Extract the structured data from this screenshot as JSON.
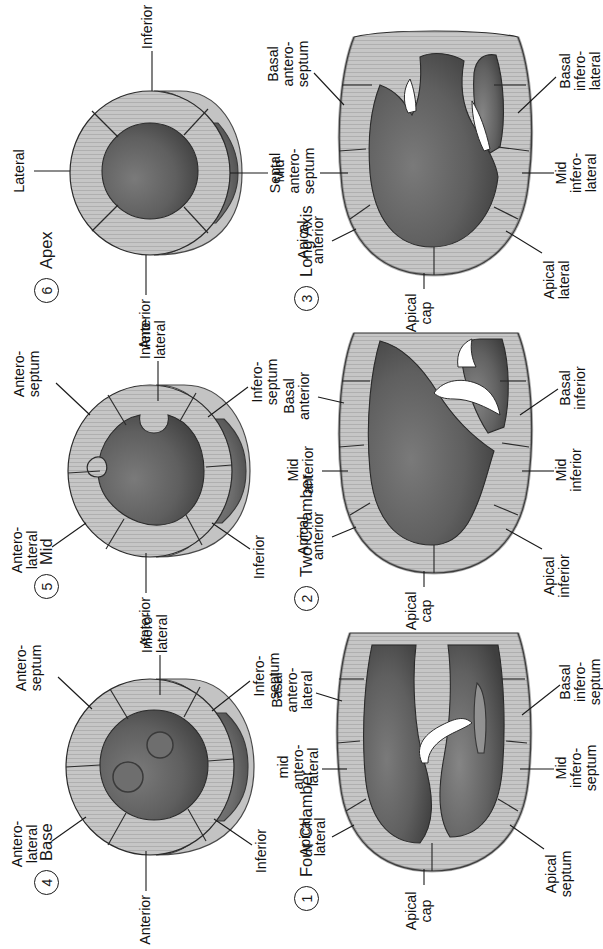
{
  "figure": {
    "orientation_note": "Figure is printed rotated 90 degrees counter-clockwise on the page",
    "background_color": "#ffffff",
    "ink_color": "#1a1a1a",
    "myocardium_color": "#c3c3c3",
    "cavity_color": "#5b5b5b"
  },
  "panels": [
    {
      "number": "1",
      "title": "Four Chamber",
      "labels": [
        "Apical cap",
        "Apical lateral",
        "mid antero-lateral",
        "Basal antero-lateral",
        "Apical septum",
        "Mid infero-septum",
        "Basal infero-septum"
      ],
      "label_lines": {
        "apical_cap": "Apical\ncap",
        "apical_lateral": "Apical\nlateral",
        "mid_antero_lateral": "mid\nantero-\nlateral",
        "basal_antero_lateral": "Basal\nantero-\nlateral",
        "apical_septum": "Apical\nseptum",
        "mid_infero_septum": "Mid\ninfero-\nseptum",
        "basal_infero_septum": "Basal\ninfero-\nseptum"
      }
    },
    {
      "number": "2",
      "title": "Two Chamber",
      "labels": [
        "Apical cap",
        "Apical anterior",
        "Mid anterior",
        "Basal anterior",
        "Apical inferior",
        "Mid inferior",
        "Basal inferior"
      ],
      "label_lines": {
        "apical_cap": "Apical\ncap",
        "apical_anterior": "Apical\nanterior",
        "mid_anterior": "Mid\nanterior",
        "basal_anterior": "Basal\nanterior",
        "apical_inferior": "Apical\ninferior",
        "mid_inferior": "Mid\ninferior",
        "basal_inferior": "Basal\ninferior"
      }
    },
    {
      "number": "3",
      "title": "Long Axis",
      "labels": [
        "Apical cap",
        "Apical anterior",
        "Mid antero-septum",
        "Basal antero-septum",
        "Apical lateral",
        "Mid infero-lateral",
        "Basal infero-lateral"
      ],
      "label_lines": {
        "apical_cap": "Apical\ncap",
        "apical_anterior": "Apical\nanterior",
        "mid_antero_septum": "Mid\nantero-\nseptum",
        "basal_antero_septum": "Basal\nantero-\nseptum",
        "apical_lateral": "Apical\nlateral",
        "mid_infero_lateral": "Mid\ninfero-\nlateral",
        "basal_infero_lateral": "Basal\ninfero-\nlateral"
      }
    },
    {
      "number": "4",
      "title": "Base",
      "labels": [
        "Anterior",
        "Antero-lateral",
        "Infero-lateral",
        "Inferior",
        "Infero-septum",
        "Antero-septum"
      ],
      "label_lines": {
        "anterior": "Anterior",
        "antero_lateral": "Antero-\nlateral",
        "infero_lateral": "Infero-\nlateral",
        "inferior": "Inferior",
        "infero_septum": "Infero-\nseptum",
        "antero_septum": "Antero-\nseptum"
      }
    },
    {
      "number": "5",
      "title": "Mid",
      "labels": [
        "Anterior",
        "Antero-lateral",
        "Infero-lateral",
        "Inferior",
        "Infero-septum",
        "Antero-septum"
      ],
      "label_lines": {
        "anterior": "Anterior",
        "antero_lateral": "Antero-\nlateral",
        "infero_lateral": "Infero-\nlateral",
        "inferior": "Inferior",
        "infero_septum": "Infero-\nseptum",
        "antero_septum": "Antero-\nseptum"
      }
    },
    {
      "number": "6",
      "title": "Apex",
      "labels": [
        "Anterior",
        "Lateral",
        "Inferior",
        "Septal"
      ],
      "label_lines": {
        "anterior": "Anterior",
        "lateral": "Lateral",
        "inferior": "Inferior",
        "septal": "Septal"
      }
    }
  ]
}
